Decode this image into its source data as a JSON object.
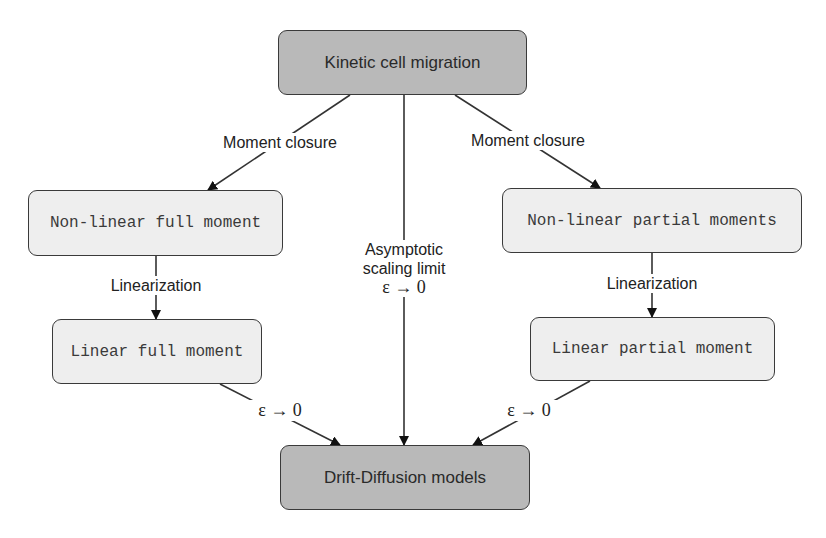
{
  "diagram": {
    "nodes": {
      "top": {
        "label": "Kinetic cell migration",
        "style": "dark"
      },
      "nl_full": {
        "label": "Non-linear full moment",
        "style": "light"
      },
      "nl_partial": {
        "label": "Non-linear partial moments",
        "style": "light"
      },
      "lin_full": {
        "label": "Linear full moment",
        "style": "light"
      },
      "lin_partial": {
        "label": "Linear partial moment",
        "style": "light"
      },
      "bottom": {
        "label": "Drift-Diffusion models",
        "style": "dark"
      }
    },
    "edge_labels": {
      "moment_closure_left": "Moment closure",
      "moment_closure_right": "Moment closure",
      "linearization_left": "Linearization",
      "linearization_right": "Linearization",
      "asymptotic_line1": "Asymptotic",
      "asymptotic_line2": "scaling limit",
      "asymptotic_line3": "ε → 0",
      "eps_left": "ε → 0",
      "eps_right": "ε → 0"
    },
    "edges": [
      {
        "from": "top",
        "to": "nl_full",
        "label": "Moment closure"
      },
      {
        "from": "top",
        "to": "nl_partial",
        "label": "Moment closure"
      },
      {
        "from": "top",
        "to": "bottom",
        "label": "Asymptotic scaling limit ε → 0"
      },
      {
        "from": "nl_full",
        "to": "lin_full",
        "label": "Linearization"
      },
      {
        "from": "nl_partial",
        "to": "lin_partial",
        "label": "Linearization"
      },
      {
        "from": "lin_full",
        "to": "bottom",
        "label": "ε → 0"
      },
      {
        "from": "lin_partial",
        "to": "bottom",
        "label": "ε → 0"
      }
    ],
    "colors": {
      "dark_fill": "#b9b9b9",
      "light_fill": "#eeeeee",
      "stroke": "#3a3a3a"
    }
  }
}
